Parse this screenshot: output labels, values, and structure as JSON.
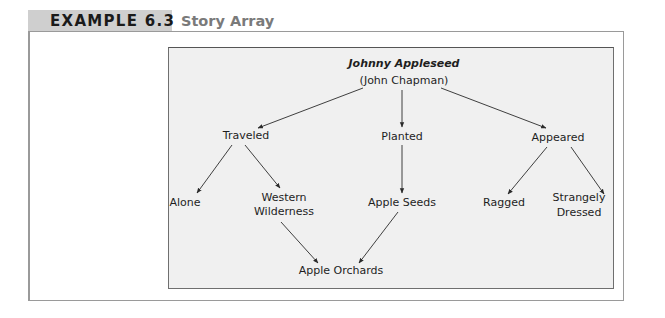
{
  "header": {
    "label": "EXAMPLE 6.3",
    "title": "Story Array"
  },
  "diagram": {
    "root": {
      "name": "Johnny Appleseed",
      "alias": "(John Chapman)"
    },
    "level1": [
      {
        "id": "traveled",
        "label": "Traveled"
      },
      {
        "id": "planted",
        "label": "Planted"
      },
      {
        "id": "appeared",
        "label": "Appeared"
      }
    ],
    "level2": [
      {
        "id": "alone",
        "label": "Alone",
        "parent": "traveled"
      },
      {
        "id": "western",
        "line1": "Western",
        "line2": "Wilderness",
        "parent": "traveled"
      },
      {
        "id": "apple-seeds",
        "label": "Apple Seeds",
        "parent": "planted"
      },
      {
        "id": "ragged",
        "label": "Ragged",
        "parent": "appeared"
      },
      {
        "id": "strangely",
        "line1": "Strangely",
        "line2": "Dressed",
        "parent": "appeared"
      }
    ],
    "level3": [
      {
        "id": "apple-orchards",
        "label": "Apple Orchards",
        "parents": [
          "western",
          "apple-seeds"
        ]
      }
    ],
    "edges": [
      [
        "root",
        "traveled"
      ],
      [
        "root",
        "planted"
      ],
      [
        "root",
        "appeared"
      ],
      [
        "traveled",
        "alone"
      ],
      [
        "traveled",
        "western"
      ],
      [
        "planted",
        "apple-seeds"
      ],
      [
        "appeared",
        "ragged"
      ],
      [
        "appeared",
        "strangely"
      ],
      [
        "western",
        "apple-orchards"
      ],
      [
        "apple-seeds",
        "apple-orchards"
      ]
    ]
  },
  "colors": {
    "header_tab": "#cfcfcf",
    "header_title": "#7a7a7a",
    "panel_bg": "#f0f0f0",
    "line": "#2a2a2a"
  }
}
